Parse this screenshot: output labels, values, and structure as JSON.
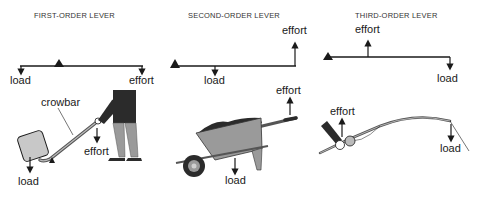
{
  "panels": [
    {
      "title": "FIRST-ORDER LEVER",
      "schematic": {
        "left_label": "load",
        "right_label": "effort"
      },
      "illustration": {
        "tool_label": "crowbar",
        "effort_label": "effort",
        "load_label": "load"
      }
    },
    {
      "title": "SECOND-ORDER LEVER",
      "schematic": {
        "effort_label": "effort",
        "load_label": "load"
      },
      "illustration": {
        "effort_label": "effort",
        "load_label": "load"
      }
    },
    {
      "title": "THIRD-ORDER LEVER",
      "schematic": {
        "effort_label": "effort",
        "load_label": "load"
      },
      "illustration": {
        "effort_label": "effort",
        "load_label": "load"
      }
    }
  ],
  "colors": {
    "line": "#1a1a1a",
    "fill_gray": "#9a9a9a",
    "fill_dark": "#2b2b2b",
    "fill_light": "#c8c8c8"
  }
}
